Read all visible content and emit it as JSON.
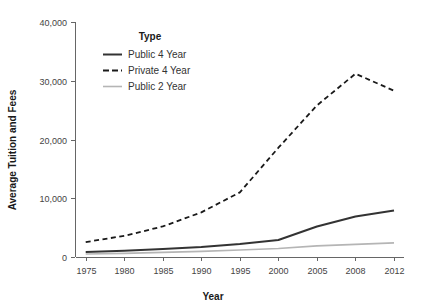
{
  "chart_data": {
    "type": "line",
    "title": "",
    "xlabel": "Year",
    "ylabel": "Average Tuition and Fees",
    "xlim": [
      1975,
      2012
    ],
    "ylim": [
      0,
      40000
    ],
    "grid": false,
    "legend_position": "top-left-inside",
    "legend_title": "Type",
    "x": [
      1975,
      1980,
      1985,
      1990,
      1995,
      2000,
      2005,
      2008,
      2012
    ],
    "xticklabels": [
      "1975",
      "1980",
      "1985",
      "1990",
      "1995",
      "2000",
      "2005",
      "2008",
      "2012"
    ],
    "yticks": [
      0,
      10000,
      20000,
      30000,
      40000
    ],
    "yticklabels": [
      "0",
      "10,000",
      "20,000",
      "30,000",
      "40,000"
    ],
    "series": [
      {
        "name": "Public 4 Year",
        "style": "solid",
        "color": "#333333",
        "width": 2,
        "values": [
          850,
          1050,
          1350,
          1700,
          2200,
          2900,
          5200,
          6900,
          7900
        ]
      },
      {
        "name": "Private 4 Year",
        "style": "dashed",
        "color": "#1a1a1a",
        "width": 1.8,
        "values": [
          2540,
          3600,
          5200,
          7600,
          11000,
          18600,
          25800,
          31200,
          28300
        ]
      },
      {
        "name": "Public 2 Year",
        "style": "solid",
        "color": "#b5b5b5",
        "width": 1.6,
        "values": [
          500,
          620,
          780,
          950,
          1200,
          1450,
          1900,
          2150,
          2400
        ]
      }
    ]
  },
  "axes": {
    "x_title": "Year",
    "y_title": "Average Tuition and Fees"
  },
  "legend": {
    "title": "Type",
    "items": [
      {
        "label": "Public 4 Year",
        "swatch": "solid-dark-line-icon"
      },
      {
        "label": "Private 4 Year",
        "swatch": "dashed-dark-line-icon"
      },
      {
        "label": "Public 2 Year",
        "swatch": "solid-gray-line-icon"
      }
    ]
  },
  "colors": {
    "public4": "#333333",
    "private4": "#1a1a1a",
    "public2": "#b5b5b5",
    "axis": "#666666",
    "text": "#333333",
    "background": "#ffffff"
  }
}
